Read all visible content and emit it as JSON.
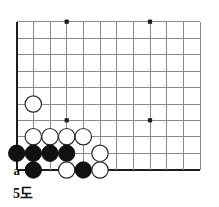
{
  "figure": {
    "caption": "5도",
    "board_type": "go-board-corner",
    "colors": {
      "grid": "#8a8a8a",
      "edge": "#1d1d1d",
      "black_stone": "#111111",
      "white_stone": "#ffffff",
      "background": "#ffffff"
    },
    "geometry": {
      "origin_x": 16.7,
      "origin_y": 21.7,
      "spacing": 16.67,
      "cols": 12,
      "rows": 10,
      "stone_radius": 8.2
    }
  },
  "grid": {
    "column_x": [
      16.7,
      33.3,
      50.0,
      66.7,
      83.3,
      100.0,
      116.7,
      133.3,
      150.0,
      166.7,
      183.3,
      200.0
    ],
    "row_y": [
      21.7,
      38.3,
      54.3,
      71.0,
      87.7,
      104.0,
      120.3,
      136.7,
      153.3,
      170.0
    ],
    "left_edge_col": 0,
    "bottom_edge_row": 9
  },
  "star_points": [
    {
      "col": 3,
      "row": 0
    },
    {
      "col": 8,
      "row": 0
    },
    {
      "col": 3,
      "row": 6
    },
    {
      "col": 8,
      "row": 6
    }
  ],
  "stones": [
    {
      "color": "white",
      "col": 1,
      "row": 5
    },
    {
      "color": "white",
      "col": 1,
      "row": 7
    },
    {
      "color": "white",
      "col": 2,
      "row": 7
    },
    {
      "color": "white",
      "col": 3,
      "row": 7
    },
    {
      "color": "white",
      "col": 4,
      "row": 7
    },
    {
      "color": "black",
      "col": 0,
      "row": 8
    },
    {
      "color": "black",
      "col": 1,
      "row": 8
    },
    {
      "color": "black",
      "col": 2,
      "row": 8
    },
    {
      "color": "black",
      "col": 3,
      "row": 8
    },
    {
      "color": "white",
      "col": 5,
      "row": 8
    },
    {
      "color": "black",
      "col": 1,
      "row": 9
    },
    {
      "color": "white",
      "col": 3,
      "row": 9
    },
    {
      "color": "black",
      "col": 4,
      "row": 9
    },
    {
      "color": "white",
      "col": 5,
      "row": 9
    }
  ],
  "labels": [
    {
      "text": "a",
      "col": 0,
      "row": 9
    }
  ]
}
